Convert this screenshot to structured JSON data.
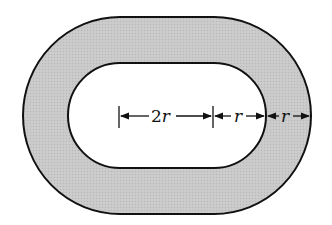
{
  "diagram": {
    "type": "stadium-annulus",
    "colors": {
      "ring_fill": "#c8c8c8",
      "inner_fill": "#ffffff",
      "stroke": "#111111",
      "background": "#ffffff"
    },
    "dimensions": [
      {
        "id": "half-straight",
        "coef": "2",
        "var": "r",
        "text": "2r"
      },
      {
        "id": "inner-radius",
        "coef": "",
        "var": "r",
        "text": "r"
      },
      {
        "id": "ring-width",
        "coef": "",
        "var": "r",
        "text": "r"
      }
    ]
  }
}
